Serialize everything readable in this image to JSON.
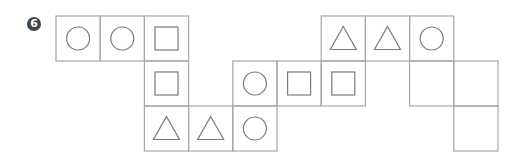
{
  "problem": {
    "number_label": "6",
    "badge_color": "#444444",
    "line_color": "#a8a8a8",
    "shape_color": "#7a7a7a"
  },
  "grid": {
    "origin_x": 56,
    "origin_y": 16,
    "cell_w": 44.2,
    "cell_h": 45,
    "cells": [
      {
        "row": 0,
        "col": 0,
        "shape": "circle"
      },
      {
        "row": 0,
        "col": 1,
        "shape": "circle"
      },
      {
        "row": 0,
        "col": 2,
        "shape": "square"
      },
      {
        "row": 0,
        "col": 6,
        "shape": "triangle"
      },
      {
        "row": 0,
        "col": 7,
        "shape": "triangle"
      },
      {
        "row": 0,
        "col": 8,
        "shape": "circle"
      },
      {
        "row": 1,
        "col": 2,
        "shape": "square"
      },
      {
        "row": 1,
        "col": 4,
        "shape": "circle"
      },
      {
        "row": 1,
        "col": 5,
        "shape": "square"
      },
      {
        "row": 1,
        "col": 6,
        "shape": "square"
      },
      {
        "row": 1,
        "col": 8,
        "shape": "empty"
      },
      {
        "row": 1,
        "col": 9,
        "shape": "empty"
      },
      {
        "row": 2,
        "col": 2,
        "shape": "triangle"
      },
      {
        "row": 2,
        "col": 3,
        "shape": "triangle"
      },
      {
        "row": 2,
        "col": 4,
        "shape": "circle"
      },
      {
        "row": 2,
        "col": 9,
        "shape": "empty"
      }
    ]
  }
}
